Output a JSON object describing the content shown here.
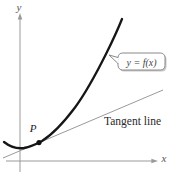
{
  "figure": {
    "labels": {
      "y_axis": "y",
      "x_axis": "x",
      "curve_callout": "y = f(x)",
      "tangent": "Tangent line",
      "point": "P"
    },
    "colors": {
      "background": "#ffffff",
      "axis": "#9a9a9a",
      "tangent_line": "#9a9a9a",
      "curve": "#161616",
      "point_dot": "#111111",
      "callout_border": "#888888",
      "callout_fill": "#ffffff",
      "callout_shadow": "#c8c8c8",
      "label_text": "#2a2a2a"
    }
  }
}
